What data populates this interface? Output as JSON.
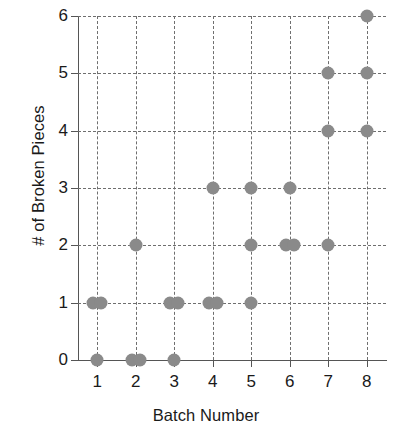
{
  "chart_data": {
    "type": "scatter",
    "title": "",
    "xlabel": "Batch Number",
    "ylabel": "# of Broken Pieces",
    "xlim": [
      0.5,
      8.5
    ],
    "ylim": [
      0,
      6
    ],
    "xticks": [
      "1",
      "2",
      "3",
      "4",
      "5",
      "6",
      "7",
      "8"
    ],
    "yticks": [
      "0",
      "1",
      "2",
      "3",
      "4",
      "5",
      "6"
    ],
    "grid": "dashed both axes",
    "legend": "none",
    "marker_color": "#8a8a8a",
    "axis_color": "#555555",
    "points": [
      {
        "x": 1,
        "y": 0
      },
      {
        "x": 1,
        "y": 1
      },
      {
        "x": 1,
        "y": 1
      },
      {
        "x": 2,
        "y": 0
      },
      {
        "x": 2,
        "y": 0
      },
      {
        "x": 2,
        "y": 2
      },
      {
        "x": 3,
        "y": 0
      },
      {
        "x": 3,
        "y": 1
      },
      {
        "x": 3,
        "y": 1
      },
      {
        "x": 4,
        "y": 1
      },
      {
        "x": 4,
        "y": 1
      },
      {
        "x": 4,
        "y": 3
      },
      {
        "x": 5,
        "y": 1
      },
      {
        "x": 5,
        "y": 2
      },
      {
        "x": 5,
        "y": 3
      },
      {
        "x": 6,
        "y": 2
      },
      {
        "x": 6,
        "y": 2
      },
      {
        "x": 6,
        "y": 3
      },
      {
        "x": 7,
        "y": 2
      },
      {
        "x": 7,
        "y": 4
      },
      {
        "x": 7,
        "y": 5
      },
      {
        "x": 8,
        "y": 4
      },
      {
        "x": 8,
        "y": 5
      },
      {
        "x": 8,
        "y": 6
      }
    ]
  }
}
